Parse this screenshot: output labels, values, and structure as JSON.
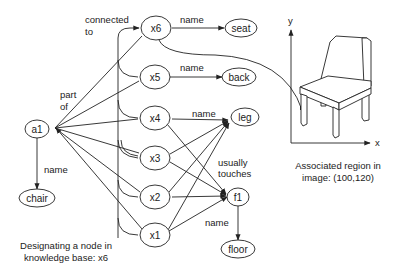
{
  "nodes": {
    "a1": "a1",
    "chair": "chair",
    "x1": "x1",
    "x2": "x2",
    "x3": "x3",
    "x4": "x4",
    "x5": "x5",
    "x6": "x6",
    "seat": "seat",
    "back": "back",
    "leg": "leg",
    "f1": "f1",
    "floor": "floor"
  },
  "edge_labels": {
    "connected_to_line1": "connected",
    "connected_to_line2": "to",
    "part_of_line1": "part",
    "part_of_line2": "of",
    "name_a1_chair": "name",
    "name_x6_seat": "name",
    "name_x5_back": "name",
    "name_x4_leg": "name",
    "usually_touches_line1": "usually",
    "usually_touches_line2": "touches",
    "name_f1_floor": "name"
  },
  "image_axes": {
    "x_label": "x",
    "y_label": "y"
  },
  "captions": {
    "region_line1": "Associated region in",
    "region_line2": "image: (100,120)",
    "designating_line1": "Designating a node in",
    "designating_line2": "knowledge base: x6"
  }
}
